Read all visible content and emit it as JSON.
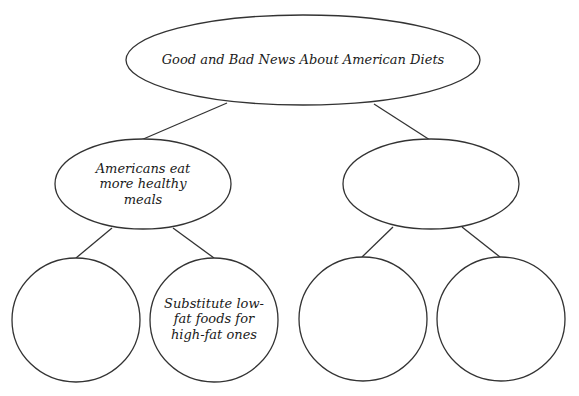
{
  "diagram": {
    "type": "tree",
    "stroke_color": "#333333",
    "root": {
      "label": "Good and Bad News About American Diets"
    },
    "children": [
      {
        "label": "Americans eat more healthy meals",
        "line1": "Americans eat",
        "line2": "more healthy",
        "line3": "meals",
        "leaves": [
          {
            "label": ""
          },
          {
            "label": "Substitute low-fat foods for high-fat ones",
            "line1": "Substitute low-",
            "line2": "fat foods for",
            "line3": "high-fat ones"
          }
        ]
      },
      {
        "label": "",
        "leaves": [
          {
            "label": ""
          },
          {
            "label": ""
          }
        ]
      }
    ]
  }
}
